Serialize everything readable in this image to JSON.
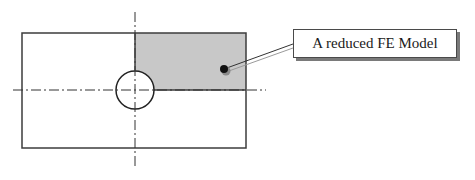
{
  "diagram": {
    "label": "A reduced FE Model",
    "colors": {
      "outline": "#3c3c3c",
      "shaded_region": "#c8c8c8",
      "dot": "#111111",
      "leader_primary": "#333333",
      "leader_secondary": "#9a9a9a",
      "centerline": "#333333"
    },
    "elements": {
      "plate": {
        "x": 22,
        "y": 33,
        "width": 224,
        "height": 115
      },
      "hole": {
        "cx": 135,
        "cy": 90,
        "r": 19
      },
      "shaded_quarter": {
        "x": 135,
        "y": 33,
        "width": 111,
        "height": 57
      },
      "vertical_centerline": {
        "x": 135,
        "y1": 12,
        "y2": 168
      },
      "horizontal_centerline": {
        "y": 90,
        "x1": 13,
        "x2": 266
      },
      "leader_dot": {
        "cx": 224,
        "cy": 69,
        "r": 4
      },
      "leader_end": {
        "x": 293,
        "y": 45
      }
    }
  }
}
